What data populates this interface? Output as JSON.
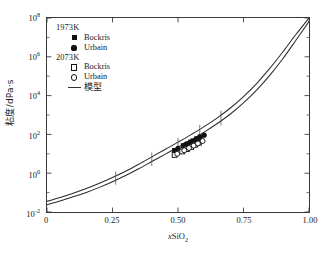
{
  "chart_data": {
    "type": "line",
    "title": "",
    "xlabel": "xSiO2",
    "ylabel": "粘度/dPa·s",
    "xlim": [
      0,
      1.0
    ],
    "ylim_log10": [
      -2,
      8
    ],
    "yscale": "log",
    "xscale": "linear",
    "grid": false,
    "legend_position": "upper-left",
    "xticks": [
      "0",
      "0.25",
      "0.50",
      "0.75",
      "1.00"
    ],
    "xtick_values": [
      0,
      0.25,
      0.5,
      0.75,
      1.0
    ],
    "yticks": [
      "10-2",
      "100",
      "102",
      "104",
      "106",
      "108"
    ],
    "ytick_exponents": [
      -2,
      0,
      2,
      4,
      6,
      8
    ],
    "series": [
      {
        "name": "模型 1973K",
        "kind": "line",
        "style": "solid",
        "color": "#2b2b2b",
        "x": [
          0.0,
          0.05,
          0.1,
          0.15,
          0.2,
          0.25,
          0.3,
          0.35,
          0.4,
          0.45,
          0.5,
          0.55,
          0.6,
          0.65,
          0.7,
          0.75,
          0.8,
          0.85,
          0.9,
          0.95,
          1.0
        ],
        "y_log10": [
          -1.45,
          -1.25,
          -1.03,
          -0.79,
          -0.52,
          -0.22,
          0.1,
          0.46,
          0.84,
          1.22,
          1.6,
          1.99,
          2.4,
          2.85,
          3.36,
          3.95,
          4.62,
          5.4,
          6.25,
          7.15,
          8.0
        ]
      },
      {
        "name": "模型 2073K",
        "kind": "line",
        "style": "solid",
        "color": "#2b2b2b",
        "x": [
          0.0,
          0.05,
          0.1,
          0.15,
          0.2,
          0.25,
          0.3,
          0.35,
          0.4,
          0.45,
          0.5,
          0.55,
          0.6,
          0.65,
          0.7,
          0.75,
          0.8,
          0.85,
          0.9,
          0.95,
          1.0
        ],
        "y_log10": [
          -1.62,
          -1.43,
          -1.22,
          -0.99,
          -0.73,
          -0.44,
          -0.12,
          0.23,
          0.6,
          0.97,
          1.34,
          1.72,
          2.12,
          2.56,
          3.05,
          3.62,
          4.28,
          5.04,
          5.9,
          6.85,
          7.82
        ]
      },
      {
        "name": "1973K Bockris",
        "kind": "scatter",
        "marker": "filled-square",
        "x": [
          0.487,
          0.52,
          0.536,
          0.548,
          0.556,
          0.572,
          0.585
        ],
        "y_log10": [
          1.17,
          1.42,
          1.51,
          1.6,
          1.66,
          1.78,
          1.87
        ]
      },
      {
        "name": "1973K Urbain",
        "kind": "scatter",
        "marker": "filled-circle",
        "x": [
          0.5,
          0.528,
          0.544,
          0.566,
          0.578,
          0.6
        ],
        "y_log10": [
          1.28,
          1.47,
          1.56,
          1.72,
          1.8,
          1.96
        ]
      },
      {
        "name": "2073K Bockris",
        "kind": "scatter",
        "marker": "open-square",
        "x": [
          0.487,
          0.516,
          0.534,
          0.55,
          0.566,
          0.58
        ],
        "y_log10": [
          0.94,
          1.12,
          1.24,
          1.35,
          1.47,
          1.57
        ]
      },
      {
        "name": "2073K Urbain",
        "kind": "scatter",
        "marker": "open-circle",
        "x": [
          0.497,
          0.524,
          0.542,
          0.56,
          0.576,
          0.594
        ],
        "y_log10": [
          1.0,
          1.18,
          1.3,
          1.42,
          1.53,
          1.66
        ]
      }
    ],
    "annotations": {
      "curve_crossticks_x": [
        0.262,
        0.4,
        0.5,
        0.583,
        0.664
      ]
    }
  },
  "legend": {
    "group1_label": "1973K",
    "group1": [
      {
        "marker": "filled-square",
        "label": "Bockris"
      },
      {
        "marker": "filled-circle",
        "label": "Urbain"
      }
    ],
    "group2_label": "2073K",
    "group2": [
      {
        "marker": "open-square",
        "label": "Bockris"
      },
      {
        "marker": "open-circle",
        "label": "Urbain"
      }
    ],
    "model": {
      "marker": "line",
      "label": "模型"
    }
  },
  "axes": {
    "y_label": "粘度/dPa·s",
    "y_label_prefix": "粘度/dPa",
    "y_label_suffix": "s",
    "x_label_italic": "x",
    "x_label_base": "SiO",
    "x_label_sub": "2",
    "ytick_labels": [
      "-2",
      "0",
      "2",
      "4",
      "6",
      "8"
    ],
    "ytick_mantissa": "10",
    "xtick_labels": [
      "0",
      "0.25",
      "0.50",
      "0.75",
      "1.00"
    ]
  },
  "colors": {
    "axis": "#3a3a3a",
    "curve": "#2b2b2b",
    "marker": "#111111",
    "background": "#ffffff"
  }
}
